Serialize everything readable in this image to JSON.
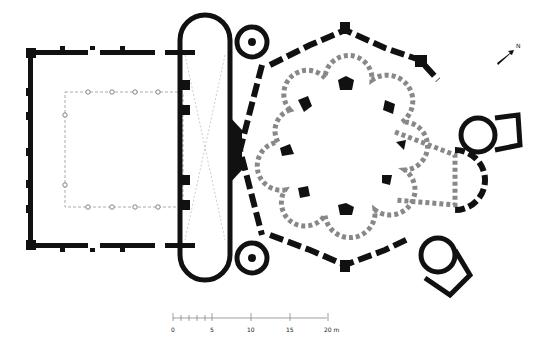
{
  "diagram": {
    "type": "architectural-floor-plan",
    "elements": {
      "atrium": "rectangular-colonnaded-courtyard",
      "narthex": "apsidal-ended-vestibule",
      "stair_towers": 2,
      "core": "octagonal-quatrefoil-niche-ring",
      "ambulatory": "outer-polygonal-wall",
      "sanctuary": "east-apse-with-side-chambers"
    },
    "colors": {
      "wall": "#111111",
      "background": "#ffffff",
      "line": "#888888"
    }
  },
  "north_arrow": {
    "label": "N"
  },
  "scale_bar": {
    "ticks": [
      "0",
      "5",
      "10",
      "15",
      "20 m"
    ]
  }
}
